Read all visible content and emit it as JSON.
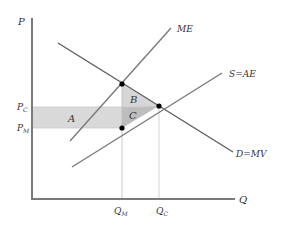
{
  "diagram": {
    "type": "economics-monopsony",
    "axes": {
      "y_label": "P",
      "x_label": "Q"
    },
    "curves": {
      "marginal_expenditure": "ME",
      "supply": "S=AE",
      "demand": "D=MV"
    },
    "price_ticks": {
      "competitive": {
        "main": "P",
        "sub": "C"
      },
      "monopsony": {
        "main": "P",
        "sub": "M"
      }
    },
    "quantity_ticks": {
      "monopsony": {
        "main": "Q",
        "sub": "M"
      },
      "competitive": {
        "main": "Q",
        "sub": "C"
      }
    },
    "regions": {
      "a": "A",
      "b": "B",
      "c": "C"
    },
    "colors": {
      "axis": "#7a7a7a",
      "curve": "#707070",
      "region_a": "#d9d9d9",
      "region_b": "#d6d6d6",
      "region_c": "#bdbdbd",
      "point": "#000000",
      "text": "#333333"
    }
  }
}
